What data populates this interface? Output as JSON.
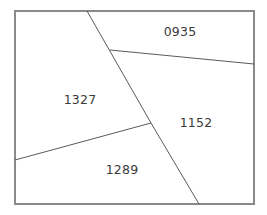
{
  "figure": {
    "type": "parcel-map-diagram",
    "background_color": "#ffffff",
    "line_color": "#5a5a5a",
    "border_color": "#8a8a8a",
    "label_color": "#3a3a3a",
    "canvas": {
      "width": 267,
      "height": 215
    },
    "boundary": {
      "name": "outer-boundary-rectangle",
      "left": 15,
      "top": 11,
      "right": 254,
      "bottom": 204,
      "stroke_width": 1.2
    },
    "dividers": [
      {
        "name": "divider-main-diagonal",
        "points": "87,11 151,123 199,204",
        "stroke_width": 1.0
      },
      {
        "name": "divider-upper-right",
        "points": "110,50 254,64",
        "stroke_width": 1.0
      },
      {
        "name": "divider-lower-left",
        "points": "15,160 151,123",
        "stroke_width": 1.0
      }
    ],
    "regions": [
      {
        "id": "region-0935",
        "label": "0935",
        "cx": 180,
        "cy": 31
      },
      {
        "id": "region-1327",
        "label": "1327",
        "cx": 80,
        "cy": 99
      },
      {
        "id": "region-1152",
        "label": "1152",
        "cx": 196,
        "cy": 122
      },
      {
        "id": "region-1289",
        "label": "1289",
        "cx": 122,
        "cy": 169
      }
    ]
  }
}
